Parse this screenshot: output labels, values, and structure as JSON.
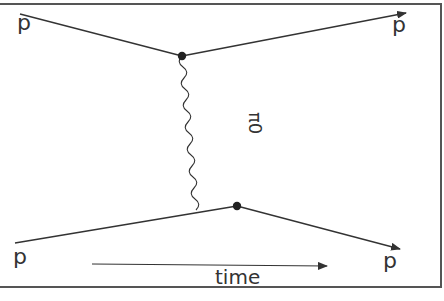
{
  "diagram": {
    "labels": {
      "incoming_top": "p",
      "outgoing_top": "p",
      "incoming_bottom": "p",
      "outgoing_bottom": "p",
      "exchange_particle": "π0",
      "time_axis": "time"
    },
    "colors": {
      "line": "#333333",
      "background": "#ffffff"
    }
  }
}
